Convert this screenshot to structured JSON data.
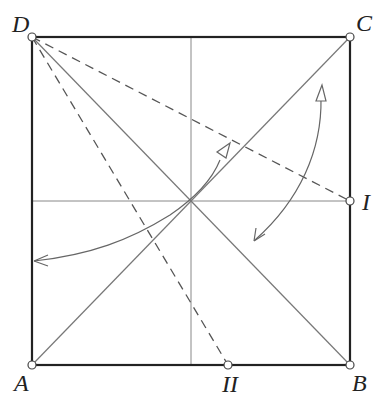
{
  "diagram": {
    "type": "origami-folding-diagram",
    "colors": {
      "outline": "#222222",
      "crease": "#777777",
      "dashed": "#555555",
      "arrow": "#666666",
      "point_fill": "#ffffff"
    },
    "points": {
      "A": {
        "label": "A",
        "x": 32,
        "y": 365
      },
      "B": {
        "label": "B",
        "x": 350,
        "y": 365
      },
      "C": {
        "label": "C",
        "x": 350,
        "y": 37
      },
      "D": {
        "label": "D",
        "x": 32,
        "y": 37
      },
      "I": {
        "label": "I",
        "x": 350,
        "y": 201
      },
      "II": {
        "label": "II",
        "x": 228,
        "y": 365
      }
    },
    "labels": {
      "A": "A",
      "B": "B",
      "C": "C",
      "D": "D",
      "I": "I",
      "II": "II"
    },
    "creases": [
      {
        "name": "diagonal-AC",
        "from": "A",
        "to": "C",
        "style": "solid"
      },
      {
        "name": "diagonal-DB",
        "from": "D",
        "to": "B",
        "style": "solid"
      },
      {
        "name": "vertical-midline",
        "style": "solid"
      },
      {
        "name": "horizontal-midline",
        "style": "solid"
      },
      {
        "name": "fold-D-I",
        "from": "D",
        "to": "I",
        "style": "dashed"
      },
      {
        "name": "fold-D-II",
        "from": "D",
        "to": "II",
        "style": "dashed"
      }
    ],
    "arrows": [
      {
        "name": "fold-arrow-left",
        "description": "curved arrow from left edge to upper-right, hollow head"
      },
      {
        "name": "fold-arrow-right",
        "description": "double-ended curved arrow near right side"
      }
    ]
  }
}
